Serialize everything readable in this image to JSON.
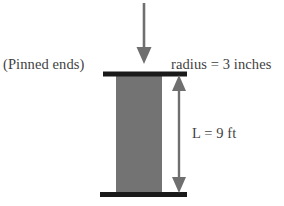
{
  "figure": {
    "type": "engineering-diagram",
    "background_color": "#ffffff"
  },
  "labels": {
    "pinned_ends": "(Pinned ends)",
    "radius": "radius = 3 inches",
    "length": "L = 9 ft"
  },
  "elements": {
    "load_arrow": {
      "name": "downward-load-arrow",
      "color": "#6f6f6f"
    },
    "top_support": {
      "name": "top-pinned-support-bar",
      "color": "#1a1a1a"
    },
    "bottom_support": {
      "name": "bottom-pinned-support-bar",
      "color": "#1a1a1a"
    },
    "column": {
      "name": "column-body",
      "color": "#737373"
    },
    "dimension_line": {
      "name": "length-dimension-line",
      "color": "#6f6f6f"
    }
  },
  "colors": {
    "column_gray": "#737373",
    "support_black": "#1a1a1a",
    "arrow_gray": "#6f6f6f",
    "text_gray": "#3f3f3f"
  }
}
